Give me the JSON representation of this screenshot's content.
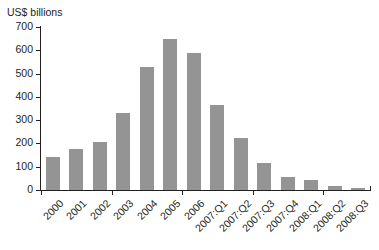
{
  "clipped_title": "",
  "axis_unit_label": "US$ billions",
  "colors": {
    "bar": "#949494",
    "axis": "#231f20",
    "text": "#231f20",
    "background": "#ffffff"
  },
  "chart_data": {
    "type": "bar",
    "title": "",
    "xlabel": "",
    "ylabel": "US$ billions",
    "ylim": [
      0,
      700
    ],
    "yticks": [
      0,
      100,
      200,
      300,
      400,
      500,
      600,
      700
    ],
    "ytick_labels": [
      "0",
      "100",
      "200",
      "300",
      "400",
      "500",
      "600",
      "700"
    ],
    "grid": false,
    "legend": false,
    "categories": [
      "2000",
      "2001",
      "2002",
      "2003",
      "2004",
      "2005",
      "2006",
      "2007:Q1",
      "2007:Q2",
      "2007:Q3",
      "2007:Q4",
      "2008:Q1",
      "2008:Q2",
      "2008:Q3"
    ],
    "values": [
      142,
      175,
      208,
      330,
      527,
      648,
      590,
      365,
      222,
      118,
      57,
      45,
      18,
      8
    ],
    "xtick_indices": [
      0,
      3,
      6,
      9,
      12
    ]
  }
}
